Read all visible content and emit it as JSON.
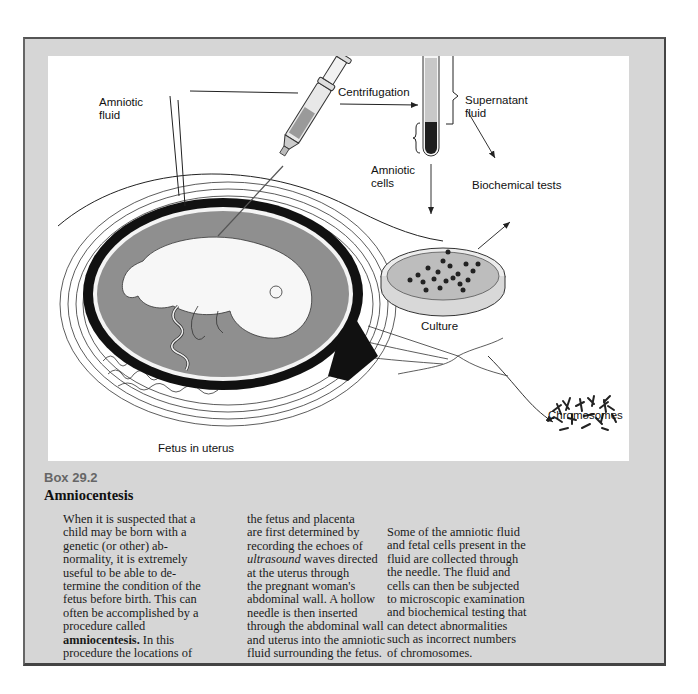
{
  "figure": {
    "labels": {
      "amniotic_fluid_line1": "Amniotic",
      "amniotic_fluid_line2": "fluid",
      "centrifugation": "Centrifugation",
      "supernatant_line1": "Supernatant",
      "supernatant_line2": "fluid",
      "amniotic_cells_line1": "Amniotic",
      "amniotic_cells_line2": "cells",
      "biochemical_tests": "Biochemical tests",
      "culture": "Culture",
      "chromosomes": "Chromosomes",
      "fetus_in_uterus": "Fetus in uterus"
    },
    "colors": {
      "frame_gray": "#d6d6d6",
      "fluid_gray": "#8f8f8f",
      "ink": "#111111"
    }
  },
  "box": {
    "number": "Box 29.2",
    "title": "Amniocentesis"
  },
  "body": {
    "col1": [
      "When it is suspected that a",
      "child may be born with a",
      "genetic (or other) ab-",
      "normality, it is extremely",
      "useful to be able to de-",
      "termine the condition of the",
      "fetus before birth. This can",
      "often be accomplished by a",
      "procedure called"
    ],
    "col1_bold_term": "amniocentesis.",
    "col1_after_bold": " In this",
    "col1_last": "procedure the locations of",
    "col2_lines_before_italic": [
      "the fetus and placenta",
      "are first determined by",
      "recording the echoes of"
    ],
    "col2_italic": "ultrasound",
    "col2_after_italic": " waves directed",
    "col2_lines_after": [
      "at the uterus through",
      "the pregnant woman's",
      "abdominal wall. A hollow",
      "needle is then inserted",
      "through the abdominal wall",
      "and uterus into the amniotic",
      "fluid surrounding the fetus."
    ],
    "col3": [
      "Some of the amniotic fluid",
      "and fetal cells present in the",
      "fluid are collected through",
      "the needle. The fluid and",
      "cells can then be subjected",
      "to microscopic examination",
      "and biochemical testing that",
      "can detect abnormalities",
      "such as incorrect numbers",
      "of chromosomes."
    ]
  }
}
